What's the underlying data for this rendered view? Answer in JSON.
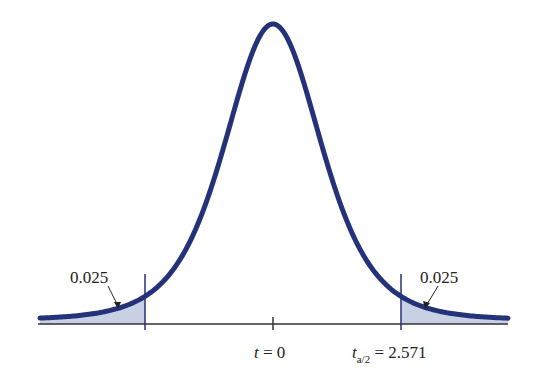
{
  "chart_data": {
    "type": "area",
    "title": "",
    "distribution": "Student t",
    "degrees_of_freedom_implied": 5,
    "xlabel": "",
    "ylabel": "",
    "grid": false,
    "legend": null,
    "center_label": "t = 0",
    "critical_label_sub": "a/2",
    "critical_label_value": "= 2.571",
    "critical_value": 2.571,
    "tails": [
      {
        "side": "left",
        "area": 0.025,
        "label": "0.025"
      },
      {
        "side": "right",
        "area": 0.025,
        "label": "0.025"
      }
    ],
    "ticks": [
      -2.571,
      0,
      2.571
    ],
    "x_range": [
      -4.5,
      4.5
    ],
    "colors": {
      "curve": "#24327a",
      "tail_fill": "#c8d0e4",
      "axis": "#333333",
      "background": "#ffffff"
    }
  },
  "labels": {
    "left_tail": "0.025",
    "right_tail": "0.025",
    "center_t": "t",
    "center_eq": " = 0",
    "crit_t": "t",
    "crit_sub": "a/2",
    "crit_eq": " = 2.571"
  }
}
